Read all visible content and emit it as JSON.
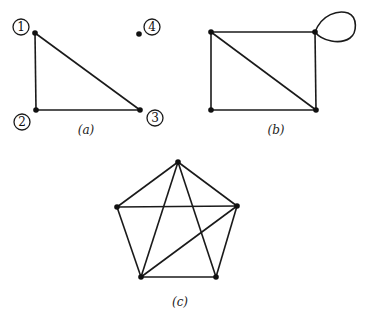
{
  "figure": {
    "graphs": [
      {
        "id": "a",
        "caption": "(a)",
        "vertices": [
          {
            "id": "1",
            "label": "1"
          },
          {
            "id": "2",
            "label": "2"
          },
          {
            "id": "3",
            "label": "3"
          },
          {
            "id": "4",
            "label": "4"
          }
        ],
        "edges": [
          [
            "1",
            "2"
          ],
          [
            "2",
            "3"
          ],
          [
            "1",
            "3"
          ]
        ],
        "isolated_vertices": [
          "4"
        ]
      },
      {
        "id": "b",
        "caption": "(b)",
        "vertices": [
          {
            "id": "tl"
          },
          {
            "id": "tr"
          },
          {
            "id": "bl"
          },
          {
            "id": "br"
          }
        ],
        "edges": [
          [
            "tl",
            "tr"
          ],
          [
            "tl",
            "bl"
          ],
          [
            "bl",
            "br"
          ],
          [
            "tr",
            "br"
          ],
          [
            "tl",
            "br"
          ]
        ],
        "loops": [
          "tr"
        ]
      },
      {
        "id": "c",
        "caption": "(c)",
        "vertices": [
          {
            "id": "top"
          },
          {
            "id": "right"
          },
          {
            "id": "bottom-right"
          },
          {
            "id": "bottom-left"
          },
          {
            "id": "left"
          }
        ],
        "edges": [
          [
            "top",
            "left"
          ],
          [
            "top",
            "right"
          ],
          [
            "left",
            "right"
          ],
          [
            "left",
            "bottom-left"
          ],
          [
            "right",
            "bottom-right"
          ],
          [
            "bottom-left",
            "bottom-right"
          ],
          [
            "top",
            "bottom-left"
          ],
          [
            "top",
            "bottom-right"
          ],
          [
            "right",
            "bottom-left"
          ]
        ]
      }
    ]
  }
}
